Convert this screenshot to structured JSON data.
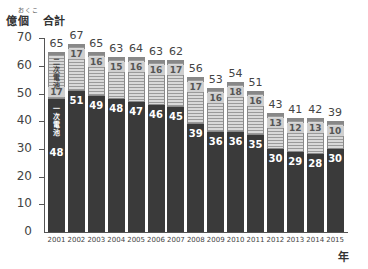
{
  "chart_data": {
    "type": "bar",
    "stacked": true,
    "title": "",
    "unit_label": "億個",
    "unit_furigana": "おくこ",
    "total_label": "合計",
    "xlabel": "年",
    "ylabel": "億個",
    "ylim": [
      0,
      70
    ],
    "yticks": [
      0,
      10,
      20,
      30,
      40,
      50,
      60,
      70
    ],
    "grid": false,
    "categories": [
      "2001",
      "2002",
      "2003",
      "2004",
      "2005",
      "2006",
      "2007",
      "2008",
      "2009",
      "2010",
      "2011",
      "2012",
      "2013",
      "2014",
      "2015"
    ],
    "series": [
      {
        "name": "一次電池",
        "style": "dark",
        "values": [
          48,
          51,
          49,
          48,
          47,
          46,
          45,
          39,
          36,
          36,
          35,
          30,
          29,
          28,
          30
        ]
      },
      {
        "name": "二次電池",
        "style": "striped",
        "values": [
          17,
          17,
          16,
          15,
          16,
          16,
          17,
          17,
          16,
          18,
          16,
          13,
          12,
          13,
          10
        ]
      }
    ],
    "totals": [
      65,
      67,
      65,
      63,
      64,
      63,
      62,
      56,
      53,
      54,
      51,
      43,
      41,
      42,
      39
    ],
    "inline_series_labels": {
      "bar_index": 0,
      "primary": "一次電池",
      "secondary": "二次電池"
    }
  },
  "colors": {
    "primary": "#3a3a3a",
    "secondary": "#d9d9d9",
    "stripe_line": "#9a9a9a",
    "axis": "#555555"
  }
}
